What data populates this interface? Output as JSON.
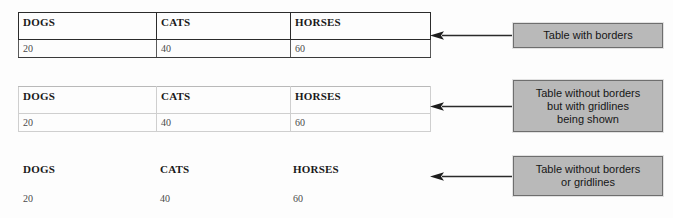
{
  "page": {
    "background_color": "#fdfdfd",
    "width": 673,
    "height": 218
  },
  "columns": [
    {
      "key": "dogs",
      "header": "DOGS",
      "value": "20"
    },
    {
      "key": "cats",
      "header": "CATS",
      "value": "40"
    },
    {
      "key": "horses",
      "header": "HORSES",
      "value": "60"
    }
  ],
  "tables": [
    {
      "id": "table-with-borders",
      "style": "bordered",
      "border_color": "#2b2b2b",
      "headers": [
        "DOGS",
        "CATS",
        "HORSES"
      ],
      "values": [
        "20",
        "40",
        "60"
      ]
    },
    {
      "id": "table-with-gridlines",
      "style": "gridlines",
      "border_color": "#cfcfcf",
      "headers": [
        "DOGS",
        "CATS",
        "HORSES"
      ],
      "values": [
        "20",
        "40",
        "60"
      ]
    },
    {
      "id": "table-plain",
      "style": "none",
      "border_color": "none",
      "headers": [
        "DOGS",
        "CATS",
        "HORSES"
      ],
      "values": [
        "20",
        "40",
        "60"
      ]
    }
  ],
  "callouts": [
    {
      "id": "callout-borders",
      "text": "Table with borders",
      "fill_color": "#b9b9b9",
      "border_color": "#6e6e6e",
      "arrow_icon": "arrow-left-icon"
    },
    {
      "id": "callout-gridlines",
      "text": "Table without borders\nbut with gridlines\nbeing shown",
      "fill_color": "#b9b9b9",
      "border_color": "#6e6e6e",
      "arrow_icon": "arrow-left-icon"
    },
    {
      "id": "callout-no-gridlines",
      "text": "Table without borders\nor gridlines",
      "fill_color": "#b9b9b9",
      "border_color": "#6e6e6e",
      "arrow_icon": "arrow-left-icon"
    }
  ]
}
